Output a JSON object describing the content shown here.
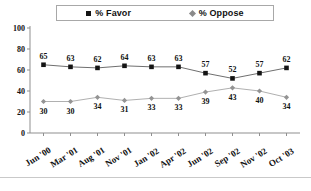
{
  "chart_data": {
    "type": "line",
    "title": "",
    "subtitle": "",
    "xlabel": "",
    "ylabel": "",
    "ylim": [
      0,
      100
    ],
    "yticks": [
      0,
      20,
      40,
      60,
      80,
      100
    ],
    "grid": false,
    "legend_position": "top",
    "categories": [
      "Jun '00",
      "Mar '01",
      "Aug '01",
      "Nov '01",
      "Jan '02",
      "Apr '02",
      "Jun '02",
      "Sep '02",
      "Nov '02",
      "Oct '03"
    ],
    "series": [
      {
        "name": "% Favor",
        "marker": "square",
        "color": "#141414",
        "values": [
          65,
          63,
          62,
          64,
          63,
          63,
          57,
          52,
          57,
          62
        ]
      },
      {
        "name": "% Oppose",
        "marker": "diamond",
        "color": "#949494",
        "values": [
          30,
          30,
          34,
          31,
          33,
          33,
          39,
          43,
          40,
          34
        ]
      }
    ]
  },
  "legend": {
    "entries": [
      {
        "label": "% Favor",
        "marker_icon": "square-marker-icon"
      },
      {
        "label": "% Oppose",
        "marker_icon": "diamond-marker-icon"
      }
    ]
  },
  "axes": {
    "y_tick_labels": [
      "100",
      "80",
      "60",
      "40",
      "20",
      "0"
    ],
    "x_tick_labels": [
      "Jun '00",
      "Mar '01",
      "Aug '01",
      "Nov '01",
      "Jan '02",
      "Apr '02",
      "Jun '02",
      "Sep '02",
      "Nov '02",
      "Oct '03"
    ]
  },
  "data_labels": {
    "favor": [
      "65",
      "63",
      "62",
      "64",
      "63",
      "63",
      "57",
      "52",
      "57",
      "62"
    ],
    "oppose": [
      "30",
      "30",
      "34",
      "31",
      "33",
      "33",
      "39",
      "43",
      "40",
      "34"
    ]
  },
  "colors": {
    "favor_marker": "#141414",
    "oppose_marker": "#949494",
    "axis": "#8f8f8f",
    "legend_border": "#a8a8a8",
    "background": "#ffffff"
  }
}
